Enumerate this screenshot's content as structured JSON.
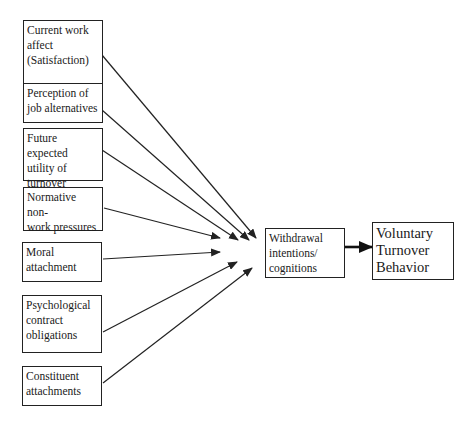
{
  "diagram": {
    "type": "flow",
    "antecedents": [
      {
        "id": "current-work-affect",
        "label": "Current work\naffect\n(Satisfaction)"
      },
      {
        "id": "perception-job-alternatives",
        "label": "Perception of\njob alternatives"
      },
      {
        "id": "future-expected-utility",
        "label": "Future expected\nutility of\nturnover"
      },
      {
        "id": "normative-nonwork-pressures",
        "label": "Normative non-\nwork pressures"
      },
      {
        "id": "moral-attachment",
        "label": "Moral\nattachment"
      },
      {
        "id": "psychological-contract",
        "label": "Psychological\ncontract\nobligations"
      },
      {
        "id": "constituent-attachments",
        "label": "Constituent\nattachments"
      }
    ],
    "mediator": {
      "id": "withdrawal-intentions",
      "label": "Withdrawal\nintentions/\ncognitions"
    },
    "outcome": {
      "id": "voluntary-turnover",
      "label": "Voluntary\nTurnover\nBehavior"
    },
    "edges": [
      {
        "from": "current-work-affect",
        "to": "withdrawal-intentions"
      },
      {
        "from": "perception-job-alternatives",
        "to": "withdrawal-intentions"
      },
      {
        "from": "future-expected-utility",
        "to": "withdrawal-intentions"
      },
      {
        "from": "normative-nonwork-pressures",
        "to": "withdrawal-intentions"
      },
      {
        "from": "moral-attachment",
        "to": "withdrawal-intentions"
      },
      {
        "from": "psychological-contract",
        "to": "withdrawal-intentions"
      },
      {
        "from": "constituent-attachments",
        "to": "withdrawal-intentions"
      },
      {
        "from": "withdrawal-intentions",
        "to": "voluntary-turnover",
        "style": "thick"
      }
    ],
    "colors": {
      "line": "#222222",
      "background": "#ffffff"
    }
  }
}
